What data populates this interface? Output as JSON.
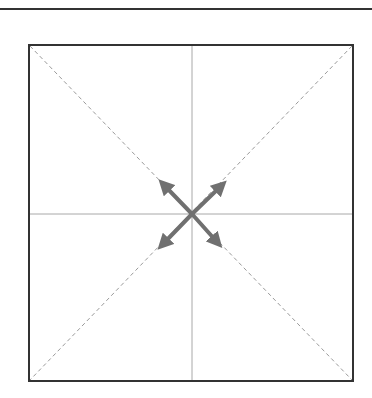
{
  "diagram": {
    "type": "square-with-diagonals-and-expand-arrows",
    "colors": {
      "background": "#ffffff",
      "border": "#333333",
      "center_lines": "#9a9a9a",
      "diagonals": "#9a9a9a",
      "arrows": "#707070",
      "top_rule": "#333333"
    },
    "square": {
      "x1": 29,
      "y1": 45,
      "x2": 353,
      "y2": 381
    },
    "center": {
      "x": 192,
      "y": 214
    },
    "arrows": [
      {
        "direction": "north-west",
        "tip": [
          160,
          181
        ]
      },
      {
        "direction": "north-east",
        "tip": [
          225,
          182
        ]
      },
      {
        "direction": "south-west",
        "tip": [
          159,
          248
        ]
      },
      {
        "direction": "south-east",
        "tip": [
          221,
          246
        ]
      }
    ],
    "labels": []
  }
}
